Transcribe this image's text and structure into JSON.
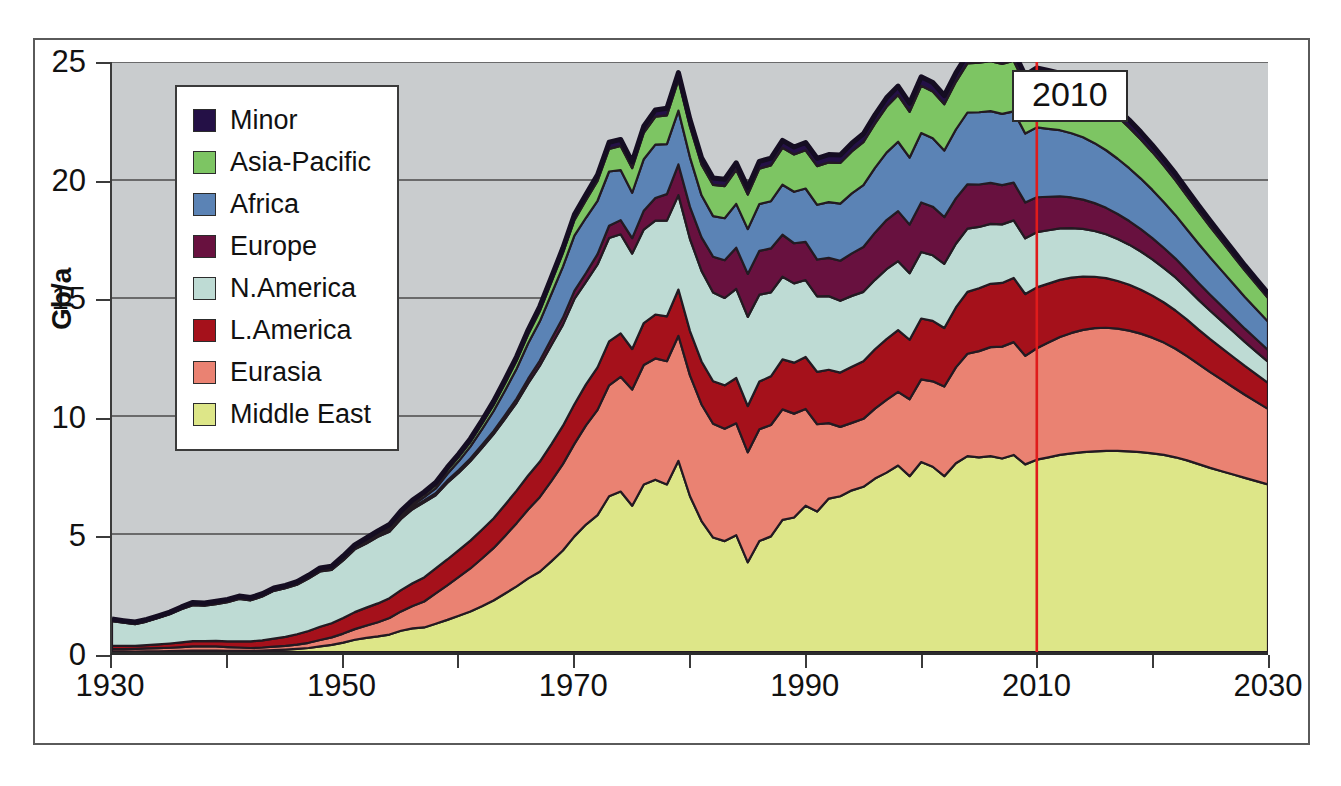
{
  "chart_data": {
    "type": "area",
    "stacked": true,
    "title": "",
    "xlabel": "",
    "ylabel": "Gb/a",
    "xlim": [
      1930,
      2030
    ],
    "ylim": [
      0,
      25
    ],
    "y_ticks": [
      0,
      5,
      10,
      15,
      20,
      25
    ],
    "x_ticks_major": [
      1930,
      1950,
      1970,
      1990,
      2010,
      2030
    ],
    "x_ticks_minor": [
      1940,
      1960,
      1980,
      2000,
      2020
    ],
    "grid": "horizontal",
    "legend_position": "upper-left",
    "plot_background": "#c9ccce",
    "annotation": {
      "label": "2010",
      "x": 2010,
      "line_color": "#e01b1b"
    },
    "legend_entries": [
      {
        "label": "Minor",
        "color": "#241046"
      },
      {
        "label": "Asia-Pacific",
        "color": "#7dc563"
      },
      {
        "label": "Africa",
        "color": "#5b83b5"
      },
      {
        "label": "Europe",
        "color": "#68113f"
      },
      {
        "label": "N.America",
        "color": "#bedbd4"
      },
      {
        "label": "L.America",
        "color": "#a5111b"
      },
      {
        "label": "Eurasia",
        "color": "#ea8272"
      },
      {
        "label": "Middle East",
        "color": "#dde688"
      }
    ],
    "stack_order_bottom_to_top": [
      "Middle East",
      "Eurasia",
      "L.America",
      "N.America",
      "Europe",
      "Africa",
      "Asia-Pacific",
      "Minor"
    ],
    "x": [
      1930,
      1931,
      1932,
      1933,
      1934,
      1935,
      1936,
      1937,
      1938,
      1939,
      1940,
      1941,
      1942,
      1943,
      1944,
      1945,
      1946,
      1947,
      1948,
      1949,
      1950,
      1951,
      1952,
      1953,
      1954,
      1955,
      1956,
      1957,
      1958,
      1959,
      1960,
      1961,
      1962,
      1963,
      1964,
      1965,
      1966,
      1967,
      1968,
      1969,
      1970,
      1971,
      1972,
      1973,
      1974,
      1975,
      1976,
      1977,
      1978,
      1979,
      1980,
      1981,
      1982,
      1983,
      1984,
      1985,
      1986,
      1987,
      1988,
      1989,
      1990,
      1991,
      1992,
      1993,
      1994,
      1995,
      1996,
      1997,
      1998,
      1999,
      2000,
      2001,
      2002,
      2003,
      2004,
      2005,
      2006,
      2007,
      2008,
      2009,
      2010,
      2011,
      2012,
      2013,
      2014,
      2015,
      2016,
      2017,
      2018,
      2019,
      2020,
      2021,
      2022,
      2023,
      2024,
      2025,
      2026,
      2027,
      2028,
      2029,
      2030
    ],
    "series": [
      {
        "name": "Middle East",
        "values": [
          0.02,
          0.02,
          0.02,
          0.03,
          0.03,
          0.04,
          0.05,
          0.06,
          0.06,
          0.06,
          0.05,
          0.05,
          0.05,
          0.06,
          0.08,
          0.1,
          0.13,
          0.17,
          0.24,
          0.3,
          0.4,
          0.52,
          0.6,
          0.66,
          0.74,
          0.9,
          1.0,
          1.04,
          1.2,
          1.36,
          1.54,
          1.72,
          1.94,
          2.18,
          2.48,
          2.78,
          3.12,
          3.4,
          3.84,
          4.3,
          4.9,
          5.4,
          5.8,
          6.6,
          6.8,
          6.2,
          7.1,
          7.3,
          7.1,
          8.1,
          6.6,
          5.55,
          4.85,
          4.7,
          4.95,
          3.8,
          4.7,
          4.9,
          5.6,
          5.7,
          6.2,
          5.95,
          6.5,
          6.6,
          6.85,
          7.0,
          7.35,
          7.6,
          7.9,
          7.45,
          8.05,
          7.85,
          7.45,
          8.0,
          8.3,
          8.25,
          8.3,
          8.2,
          8.35,
          7.95,
          8.15,
          8.25,
          8.35,
          8.42,
          8.47,
          8.5,
          8.52,
          8.52,
          8.5,
          8.47,
          8.42,
          8.35,
          8.25,
          8.12,
          7.96,
          7.8,
          7.66,
          7.52,
          7.38,
          7.24,
          7.1
        ]
      },
      {
        "name": "Eurasia",
        "values": [
          0.1,
          0.1,
          0.11,
          0.12,
          0.13,
          0.14,
          0.16,
          0.18,
          0.18,
          0.18,
          0.16,
          0.14,
          0.12,
          0.13,
          0.15,
          0.16,
          0.18,
          0.22,
          0.27,
          0.32,
          0.38,
          0.45,
          0.52,
          0.6,
          0.7,
          0.82,
          0.95,
          1.1,
          1.28,
          1.46,
          1.64,
          1.82,
          2.02,
          2.22,
          2.44,
          2.68,
          2.92,
          3.16,
          3.4,
          3.66,
          3.92,
          4.2,
          4.46,
          4.7,
          4.86,
          4.92,
          5.06,
          5.14,
          5.22,
          5.3,
          5.12,
          4.94,
          4.82,
          4.76,
          4.74,
          4.66,
          4.74,
          4.72,
          4.68,
          4.4,
          4.1,
          3.7,
          3.2,
          2.94,
          2.86,
          2.88,
          2.96,
          3.08,
          3.12,
          3.26,
          3.5,
          3.62,
          3.8,
          4.06,
          4.34,
          4.5,
          4.62,
          4.74,
          4.78,
          4.6,
          4.72,
          4.86,
          5.0,
          5.1,
          5.18,
          5.22,
          5.22,
          5.18,
          5.12,
          5.02,
          4.9,
          4.76,
          4.6,
          4.42,
          4.24,
          4.06,
          3.88,
          3.7,
          3.52,
          3.36,
          3.2
        ]
      },
      {
        "name": "L.America",
        "values": [
          0.14,
          0.14,
          0.13,
          0.14,
          0.16,
          0.18,
          0.2,
          0.22,
          0.22,
          0.23,
          0.24,
          0.26,
          0.28,
          0.3,
          0.34,
          0.38,
          0.44,
          0.5,
          0.56,
          0.6,
          0.66,
          0.72,
          0.76,
          0.8,
          0.84,
          0.9,
          0.96,
          1.02,
          1.06,
          1.1,
          1.14,
          1.18,
          1.22,
          1.26,
          1.32,
          1.38,
          1.44,
          1.5,
          1.56,
          1.62,
          1.68,
          1.74,
          1.8,
          1.86,
          1.84,
          1.72,
          1.78,
          1.86,
          1.9,
          1.96,
          1.88,
          1.82,
          1.8,
          1.84,
          1.92,
          1.96,
          2.02,
          2.06,
          2.12,
          2.16,
          2.2,
          2.22,
          2.26,
          2.3,
          2.38,
          2.44,
          2.52,
          2.58,
          2.62,
          2.52,
          2.58,
          2.56,
          2.48,
          2.54,
          2.62,
          2.66,
          2.68,
          2.7,
          2.72,
          2.62,
          2.58,
          2.5,
          2.42,
          2.34,
          2.26,
          2.18,
          2.1,
          2.02,
          1.94,
          1.86,
          1.78,
          1.7,
          1.62,
          1.54,
          1.46,
          1.4,
          1.34,
          1.28,
          1.22,
          1.16,
          1.1
        ]
      },
      {
        "name": "N.America",
        "values": [
          1.05,
          0.98,
          0.92,
          1.0,
          1.12,
          1.24,
          1.4,
          1.52,
          1.5,
          1.56,
          1.66,
          1.8,
          1.74,
          1.86,
          2.02,
          2.06,
          2.1,
          2.22,
          2.34,
          2.26,
          2.44,
          2.66,
          2.72,
          2.82,
          2.82,
          3.02,
          3.14,
          3.18,
          3.1,
          3.24,
          3.28,
          3.36,
          3.46,
          3.56,
          3.64,
          3.72,
          3.9,
          4.06,
          4.2,
          4.28,
          4.46,
          4.34,
          4.36,
          4.38,
          4.2,
          4.04,
          3.96,
          3.98,
          4.06,
          4.0,
          3.9,
          3.84,
          3.76,
          3.7,
          3.78,
          3.78,
          3.68,
          3.56,
          3.5,
          3.36,
          3.26,
          3.2,
          3.12,
          3.04,
          3.0,
          2.94,
          2.94,
          2.96,
          2.92,
          2.82,
          2.82,
          2.78,
          2.72,
          2.7,
          2.68,
          2.6,
          2.54,
          2.48,
          2.44,
          2.36,
          2.34,
          2.26,
          2.18,
          2.1,
          2.02,
          1.94,
          1.86,
          1.78,
          1.7,
          1.62,
          1.54,
          1.46,
          1.4,
          1.32,
          1.26,
          1.2,
          1.14,
          1.08,
          1.02,
          0.96,
          0.9
        ]
      },
      {
        "name": "Europe",
        "values": [
          0.01,
          0.01,
          0.01,
          0.01,
          0.01,
          0.01,
          0.02,
          0.02,
          0.02,
          0.02,
          0.02,
          0.02,
          0.02,
          0.02,
          0.02,
          0.02,
          0.03,
          0.03,
          0.03,
          0.03,
          0.04,
          0.04,
          0.05,
          0.05,
          0.06,
          0.07,
          0.08,
          0.08,
          0.09,
          0.1,
          0.11,
          0.12,
          0.13,
          0.14,
          0.16,
          0.18,
          0.2,
          0.22,
          0.26,
          0.3,
          0.34,
          0.38,
          0.44,
          0.52,
          0.6,
          0.66,
          0.8,
          0.96,
          1.12,
          1.3,
          1.36,
          1.42,
          1.52,
          1.6,
          1.74,
          1.82,
          1.86,
          1.86,
          1.78,
          1.7,
          1.62,
          1.56,
          1.62,
          1.7,
          1.8,
          1.9,
          2.0,
          2.08,
          2.12,
          2.06,
          2.1,
          2.06,
          1.98,
          1.92,
          1.88,
          1.8,
          1.74,
          1.66,
          1.6,
          1.52,
          1.48,
          1.42,
          1.36,
          1.3,
          1.24,
          1.18,
          1.12,
          1.06,
          1.0,
          0.95,
          0.9,
          0.85,
          0.8,
          0.76,
          0.72,
          0.68,
          0.64,
          0.6,
          0.56,
          0.53,
          0.5
        ]
      },
      {
        "name": "Africa",
        "values": [
          0.01,
          0.01,
          0.01,
          0.01,
          0.01,
          0.01,
          0.01,
          0.01,
          0.01,
          0.01,
          0.01,
          0.01,
          0.01,
          0.01,
          0.01,
          0.01,
          0.01,
          0.01,
          0.01,
          0.02,
          0.02,
          0.02,
          0.03,
          0.04,
          0.06,
          0.08,
          0.1,
          0.14,
          0.2,
          0.28,
          0.38,
          0.5,
          0.66,
          0.84,
          1.04,
          1.26,
          1.5,
          1.66,
          1.9,
          2.16,
          2.34,
          2.34,
          2.26,
          2.3,
          2.12,
          1.92,
          2.18,
          2.26,
          2.12,
          2.28,
          2.1,
          1.78,
          1.72,
          1.78,
          1.86,
          1.9,
          1.98,
          2.0,
          2.12,
          2.18,
          2.26,
          2.32,
          2.36,
          2.42,
          2.54,
          2.62,
          2.74,
          2.86,
          2.94,
          2.84,
          2.94,
          2.9,
          2.82,
          2.92,
          3.04,
          3.06,
          3.04,
          3.02,
          3.02,
          2.92,
          2.96,
          2.88,
          2.8,
          2.72,
          2.64,
          2.54,
          2.44,
          2.34,
          2.24,
          2.14,
          2.04,
          1.94,
          1.84,
          1.74,
          1.66,
          1.58,
          1.5,
          1.42,
          1.34,
          1.27,
          1.2
        ]
      },
      {
        "name": "Asia-Pacific",
        "values": [
          0.03,
          0.03,
          0.03,
          0.03,
          0.03,
          0.03,
          0.03,
          0.04,
          0.04,
          0.04,
          0.04,
          0.04,
          0.04,
          0.04,
          0.04,
          0.04,
          0.04,
          0.04,
          0.05,
          0.05,
          0.06,
          0.06,
          0.07,
          0.08,
          0.09,
          0.1,
          0.11,
          0.12,
          0.14,
          0.16,
          0.18,
          0.2,
          0.23,
          0.26,
          0.3,
          0.34,
          0.38,
          0.44,
          0.5,
          0.58,
          0.66,
          0.74,
          0.84,
          0.96,
          1.02,
          1.04,
          1.12,
          1.18,
          1.22,
          1.3,
          1.3,
          1.3,
          1.32,
          1.36,
          1.44,
          1.46,
          1.5,
          1.52,
          1.56,
          1.58,
          1.62,
          1.64,
          1.68,
          1.72,
          1.78,
          1.82,
          1.88,
          1.94,
          1.98,
          1.94,
          2.0,
          1.98,
          1.96,
          2.02,
          2.08,
          2.1,
          2.12,
          2.12,
          2.14,
          2.08,
          2.12,
          2.08,
          2.04,
          2.0,
          1.96,
          1.9,
          1.84,
          1.78,
          1.72,
          1.66,
          1.6,
          1.54,
          1.48,
          1.42,
          1.36,
          1.3,
          1.24,
          1.18,
          1.12,
          1.06,
          1.0
        ]
      },
      {
        "name": "Minor",
        "values": [
          0.04,
          0.04,
          0.04,
          0.04,
          0.04,
          0.04,
          0.04,
          0.05,
          0.05,
          0.05,
          0.05,
          0.05,
          0.05,
          0.05,
          0.05,
          0.05,
          0.05,
          0.06,
          0.06,
          0.06,
          0.07,
          0.07,
          0.08,
          0.08,
          0.09,
          0.09,
          0.1,
          0.1,
          0.11,
          0.12,
          0.13,
          0.14,
          0.15,
          0.16,
          0.17,
          0.18,
          0.19,
          0.2,
          0.21,
          0.22,
          0.24,
          0.25,
          0.26,
          0.28,
          0.28,
          0.27,
          0.28,
          0.29,
          0.3,
          0.31,
          0.3,
          0.29,
          0.29,
          0.29,
          0.3,
          0.3,
          0.31,
          0.31,
          0.32,
          0.32,
          0.33,
          0.33,
          0.34,
          0.34,
          0.35,
          0.36,
          0.37,
          0.38,
          0.38,
          0.37,
          0.38,
          0.38,
          0.37,
          0.38,
          0.39,
          0.39,
          0.4,
          0.4,
          0.4,
          0.39,
          0.4,
          0.39,
          0.38,
          0.37,
          0.36,
          0.35,
          0.34,
          0.33,
          0.32,
          0.31,
          0.3,
          0.29,
          0.28,
          0.27,
          0.26,
          0.25,
          0.24,
          0.23,
          0.22,
          0.21,
          0.2
        ]
      }
    ]
  },
  "axes": {
    "y_label": "Gb/a",
    "y_ticks": [
      "25",
      "20",
      "15",
      "10",
      "5",
      "0"
    ],
    "x_ticks": [
      "1930",
      "1950",
      "1970",
      "1990",
      "2010",
      "2030"
    ]
  },
  "legend": {
    "items": [
      {
        "label": "Minor"
      },
      {
        "label": "Asia-Pacific"
      },
      {
        "label": "Africa"
      },
      {
        "label": "Europe"
      },
      {
        "label": "N.America"
      },
      {
        "label": "L.America"
      },
      {
        "label": "Eurasia"
      },
      {
        "label": "Middle East"
      }
    ]
  },
  "annotation": {
    "year_label": "2010"
  }
}
